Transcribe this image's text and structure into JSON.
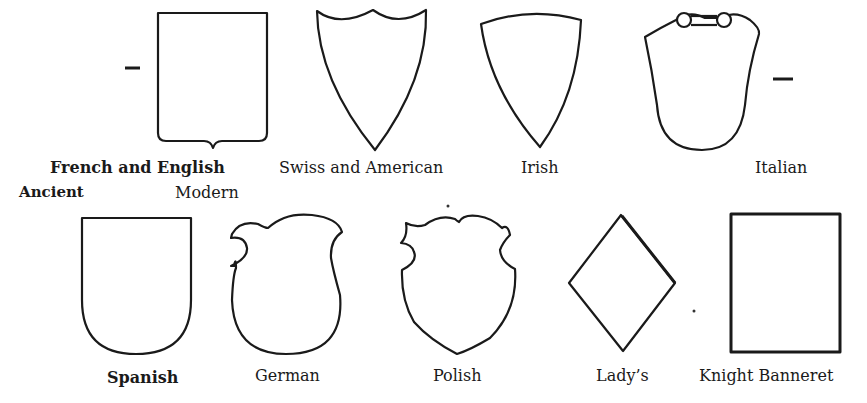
{
  "figure": {
    "row1": [
      {
        "id": "french-english",
        "label_line1": "French and English",
        "label_line2_left": "Ancient",
        "label_line2_right": "Modern"
      },
      {
        "id": "swiss-american",
        "label": "Swiss and American"
      },
      {
        "id": "irish",
        "label": "Irish"
      },
      {
        "id": "italian",
        "label": "Italian"
      }
    ],
    "row2": [
      {
        "id": "spanish",
        "label": "Spanish"
      },
      {
        "id": "german",
        "label": "German"
      },
      {
        "id": "polish",
        "label": "Polish"
      },
      {
        "id": "ladys",
        "label": "Lady’s"
      },
      {
        "id": "knight-banneret",
        "label": "Knight Banneret"
      }
    ],
    "colors": {
      "ink": "#1a1a1a",
      "paper": "#ffffff"
    }
  }
}
